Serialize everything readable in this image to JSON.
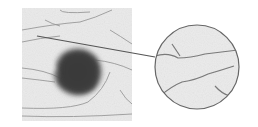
{
  "figure": {
    "colors": {
      "background": "#ffffff",
      "skin": "#e8e8e8",
      "lesion": "#3c3c3c",
      "crease": "#8a8a8a",
      "pointer_line": "#555555",
      "inset_border": "#6a6a6a"
    }
  }
}
